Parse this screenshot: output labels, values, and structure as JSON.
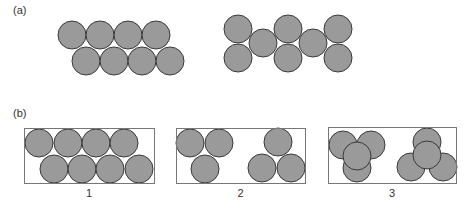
{
  "figure": {
    "panel_a": {
      "label": "(a)",
      "arrangements": [
        {
          "name": "offset-rows",
          "circles": [
            {
              "cx": 72,
              "cy": 35
            },
            {
              "cx": 100,
              "cy": 35
            },
            {
              "cx": 128,
              "cy": 35
            },
            {
              "cx": 156,
              "cy": 35
            },
            {
              "cx": 86,
              "cy": 61
            },
            {
              "cx": 114,
              "cy": 61
            },
            {
              "cx": 142,
              "cy": 61
            },
            {
              "cx": 170,
              "cy": 61
            }
          ]
        },
        {
          "name": "zigzag",
          "circles": [
            {
              "cx": 238,
              "cy": 29
            },
            {
              "cx": 238,
              "cy": 58
            },
            {
              "cx": 263,
              "cy": 43
            },
            {
              "cx": 288,
              "cy": 29
            },
            {
              "cx": 288,
              "cy": 58
            },
            {
              "cx": 313,
              "cy": 43
            },
            {
              "cx": 338,
              "cy": 29
            },
            {
              "cx": 338,
              "cy": 58
            }
          ]
        }
      ]
    },
    "panel_b": {
      "label": "(b)",
      "boxes": [
        {
          "caption": "1",
          "frame": {
            "x": 24,
            "y": 128,
            "w": 130,
            "h": 55
          },
          "circles": [
            {
              "cx": 39,
              "cy": 143
            },
            {
              "cx": 68,
              "cy": 143
            },
            {
              "cx": 96,
              "cy": 143
            },
            {
              "cx": 124,
              "cy": 143
            },
            {
              "cx": 54,
              "cy": 169
            },
            {
              "cx": 82,
              "cy": 169
            },
            {
              "cx": 110,
              "cy": 169
            },
            {
              "cx": 139,
              "cy": 169
            }
          ]
        },
        {
          "caption": "2",
          "frame": {
            "x": 176,
            "y": 128,
            "w": 129,
            "h": 55
          },
          "circles": [
            {
              "cx": 190,
              "cy": 143
            },
            {
              "cx": 219,
              "cy": 143
            },
            {
              "cx": 205,
              "cy": 169
            },
            {
              "cx": 278,
              "cy": 142
            },
            {
              "cx": 262,
              "cy": 168
            },
            {
              "cx": 291,
              "cy": 168
            }
          ]
        },
        {
          "caption": "3",
          "frame": {
            "x": 328,
            "y": 127,
            "w": 128,
            "h": 56
          },
          "circles": [
            {
              "cx": 343,
              "cy": 145
            },
            {
              "cx": 371,
              "cy": 145
            },
            {
              "cx": 357,
              "cy": 168
            },
            {
              "cx": 357,
              "cy": 156
            },
            {
              "cx": 427,
              "cy": 142
            },
            {
              "cx": 411,
              "cy": 167
            },
            {
              "cx": 443,
              "cy": 167
            },
            {
              "cx": 427,
              "cy": 155
            }
          ]
        }
      ]
    },
    "circle_radius": 14,
    "colors": {
      "fill": "#9a9a9a",
      "stroke": "#3a3a3a",
      "frame": "#777777"
    }
  }
}
